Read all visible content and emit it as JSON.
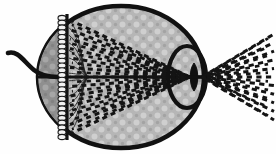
{
  "figure": {
    "background_color": "#fefefe"
  },
  "colors": {
    "outline": "#111111",
    "sclera_fill_light": "#b4b4b4",
    "sclera_fill_dark": "#8e8e8e",
    "vitreous_texture_light": "#c9c9c9",
    "vitreous_texture_dark": "#9a9a9a",
    "receptor_fill": "#f2f2f2",
    "receptor_stroke": "#1a1a1a",
    "ray_color": "#141414",
    "nerve_fiber_color": "#1a1a1a",
    "lens_fill": "#101010",
    "cornea_stroke": "#111111"
  },
  "parts": [
    {
      "id": "eyeball",
      "label": "eyeball-sclera",
      "shape": "ellipse",
      "cx": 121,
      "cy": 77,
      "rx": 83,
      "ry": 71,
      "stroke_width": 4.5
    },
    {
      "id": "posterior-chamber",
      "label": "posterior-dark-sector",
      "shape": "sector",
      "fill": "#8e8e8e"
    },
    {
      "id": "retina-line",
      "label": "retina-boundary",
      "shape": "line",
      "x": 67,
      "y1": 14,
      "y2": 140,
      "stroke_width": 3
    },
    {
      "id": "optic-nerve",
      "label": "optic-nerve-bundle",
      "shape": "path",
      "stroke_width": 4.5
    },
    {
      "id": "optic-axis",
      "label": "optical-axis",
      "shape": "line",
      "x1": 38,
      "y1": 77,
      "x2": 205,
      "y2": 77,
      "stroke_width": 3.2
    },
    {
      "id": "cornea",
      "label": "cornea-anterior-chamber",
      "shape": "ellipse",
      "cx": 187,
      "cy": 77,
      "rx": 19,
      "ry": 31,
      "stroke_width": 4
    },
    {
      "id": "lens",
      "label": "crystalline-lens",
      "shape": "biconvex",
      "cx": 194,
      "cy": 77,
      "rx": 5,
      "ry": 14
    },
    {
      "id": "pupil-aperture",
      "label": "pupil-aperture",
      "shape": "point",
      "cx": 194,
      "cy": 77
    }
  ],
  "photoreceptors": {
    "label": "photoreceptor-cell-column",
    "count": 26,
    "x": 62,
    "y_start": 18,
    "y_end": 137,
    "cell_rx": 4.0,
    "cell_ry": 2.6
  },
  "nerve_fibers": {
    "label": "nerve-fiber-layer",
    "count": 16,
    "origin_x": 88,
    "origin_y": 77,
    "fan_top": 20,
    "fan_bottom": 134
  },
  "ray_bundles": [
    {
      "id": "internal-rays",
      "label": "refracted-light-rays-inside-eye",
      "region": "vitreous",
      "focus_x": 190,
      "focus_y": 77,
      "spread_x": 72,
      "n_rays": 13,
      "top_y": 20,
      "bottom_y": 134,
      "dash": "5 4",
      "width": 3.0
    },
    {
      "id": "external-rays",
      "label": "incoming-light-rays-outside-eye",
      "region": "air",
      "origin_x": 202,
      "origin_y": 77,
      "end_x": 274,
      "n_rays": 11,
      "top_y": 34,
      "bottom_y": 120,
      "dash": "5 4",
      "width": 3.0
    }
  ],
  "annotations": {
    "visible_text": []
  }
}
